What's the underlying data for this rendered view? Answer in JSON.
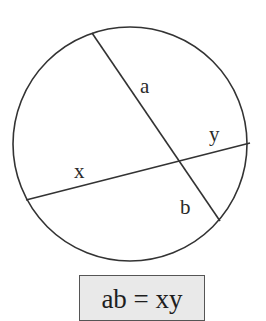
{
  "diagram": {
    "circle": {
      "cx": 130,
      "cy": 144,
      "r": 117,
      "stroke": "#333333"
    },
    "chords": [
      {
        "name": "chord-ab",
        "x1": 92,
        "y1": 33,
        "x2": 220,
        "y2": 221
      },
      {
        "name": "chord-xy",
        "x1": 26,
        "y1": 200,
        "x2": 250,
        "y2": 143
      }
    ],
    "intersection": {
      "x": 179,
      "y": 161
    },
    "labels": {
      "a": "a",
      "b": "b",
      "x": "x",
      "y": "y"
    }
  },
  "formula": {
    "text": "ab = xy",
    "background": "#e9e9e9"
  }
}
